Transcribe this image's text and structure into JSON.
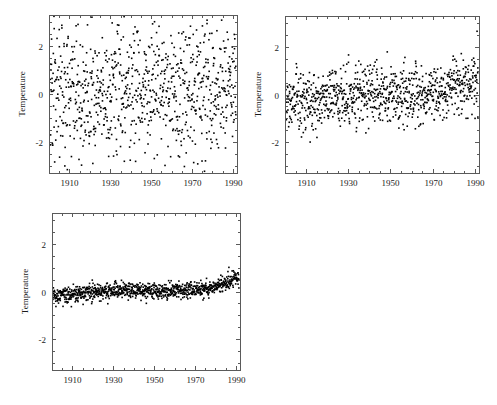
{
  "figure": {
    "background": "#ffffff",
    "point_color": "#000000",
    "axis_color": "#5a5a5a",
    "panel_count": 3
  },
  "chart_data": [
    {
      "id": "panel-a",
      "type": "scatter",
      "title": "",
      "xlabel": "",
      "ylabel": "Temperature",
      "xlim": [
        1900,
        1992
      ],
      "ylim": [
        -3.3,
        3.3
      ],
      "xticks": [
        1910,
        1930,
        1950,
        1970,
        1990
      ],
      "xticklabels": [
        "1910",
        "1930",
        "1950",
        "1970",
        "1990"
      ],
      "yticks": [
        -2,
        0,
        2
      ],
      "yticklabels": [
        "-2",
        "0",
        "2"
      ],
      "grid": false,
      "legend": null,
      "n_points": 900,
      "marker": "square",
      "marker_size": 1.6,
      "noise_sigma": 1.45,
      "trend_intercept": -0.05,
      "trend_slope_per_year": 0.004,
      "seed": 10427
    },
    {
      "id": "panel-b",
      "type": "scatter",
      "title": "",
      "xlabel": "",
      "ylabel": "Temperature",
      "xlim": [
        1900,
        1992
      ],
      "ylim": [
        -3.3,
        3.3
      ],
      "xticks": [
        1910,
        1930,
        1950,
        1970,
        1990
      ],
      "xticklabels": [
        "1910",
        "1930",
        "1950",
        "1970",
        "1990"
      ],
      "yticks": [
        -2,
        0,
        2
      ],
      "yticklabels": [
        "-2",
        "0",
        "2"
      ],
      "grid": false,
      "legend": null,
      "n_points": 950,
      "marker": "square",
      "marker_size": 1.6,
      "noise_sigma": 0.62,
      "trend_intercept": -0.38,
      "trend_slope_per_year": 0.0085,
      "seed": 22193
    },
    {
      "id": "panel-c",
      "type": "scatter",
      "title": "",
      "xlabel": "",
      "ylabel": "Temperature",
      "xlim": [
        1900,
        1992
      ],
      "ylim": [
        -3.3,
        3.3
      ],
      "xticks": [
        1910,
        1930,
        1950,
        1970,
        1990
      ],
      "xticklabels": [
        "1910",
        "1930",
        "1950",
        "1970",
        "1990"
      ],
      "yticks": [
        -2,
        0,
        2
      ],
      "yticklabels": [
        "-2",
        "0",
        "2"
      ],
      "grid": false,
      "legend": null,
      "n_points": 1000,
      "marker": "square",
      "marker_size": 1.6,
      "noise_sigma": 0.175,
      "trend_intercept": -0.22,
      "trend_slope_per_year": 0.0055,
      "seed": 38851
    }
  ]
}
